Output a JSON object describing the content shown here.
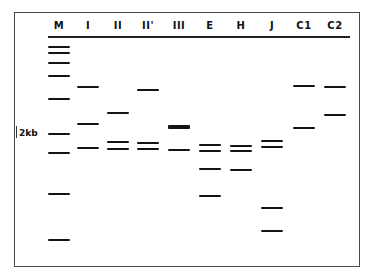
{
  "diagram": {
    "type": "gel-electrophoresis-schematic",
    "band_color": "#141414",
    "frame_color": "#4a4a4a",
    "size_marker": {
      "label": "2kb",
      "y": 134
    },
    "lanes": [
      {
        "id": "M",
        "label": "M",
        "x": 59,
        "bands": [
          {
            "y": 47
          },
          {
            "y": 53
          },
          {
            "y": 63
          },
          {
            "y": 76
          },
          {
            "y": 99
          },
          {
            "y": 134
          },
          {
            "y": 153
          },
          {
            "y": 194
          },
          {
            "y": 240
          }
        ]
      },
      {
        "id": "I",
        "label": "I",
        "x": 88,
        "bands": [
          {
            "y": 87
          },
          {
            "y": 124
          },
          {
            "y": 148
          }
        ]
      },
      {
        "id": "II",
        "label": "II",
        "x": 118,
        "bands": [
          {
            "y": 113
          },
          {
            "y": 142
          },
          {
            "y": 149
          }
        ]
      },
      {
        "id": "IIp",
        "label": "II'",
        "x": 148,
        "bands": [
          {
            "y": 90
          },
          {
            "y": 143
          },
          {
            "y": 149
          }
        ]
      },
      {
        "id": "III",
        "label": "III",
        "x": 179,
        "bands": [
          {
            "y": 127,
            "thick": true
          },
          {
            "y": 150
          }
        ]
      },
      {
        "id": "E",
        "label": "E",
        "x": 210,
        "bands": [
          {
            "y": 145
          },
          {
            "y": 151
          },
          {
            "y": 169
          },
          {
            "y": 196
          }
        ]
      },
      {
        "id": "H",
        "label": "H",
        "x": 241,
        "bands": [
          {
            "y": 146
          },
          {
            "y": 151
          },
          {
            "y": 170
          }
        ]
      },
      {
        "id": "J",
        "label": "J",
        "x": 272,
        "bands": [
          {
            "y": 141
          },
          {
            "y": 147
          },
          {
            "y": 208
          },
          {
            "y": 231
          }
        ]
      },
      {
        "id": "C1",
        "label": "C1",
        "x": 304,
        "bands": [
          {
            "y": 86
          },
          {
            "y": 128
          }
        ]
      },
      {
        "id": "C2",
        "label": "C2",
        "x": 335,
        "bands": [
          {
            "y": 87
          },
          {
            "y": 115
          }
        ]
      }
    ]
  }
}
